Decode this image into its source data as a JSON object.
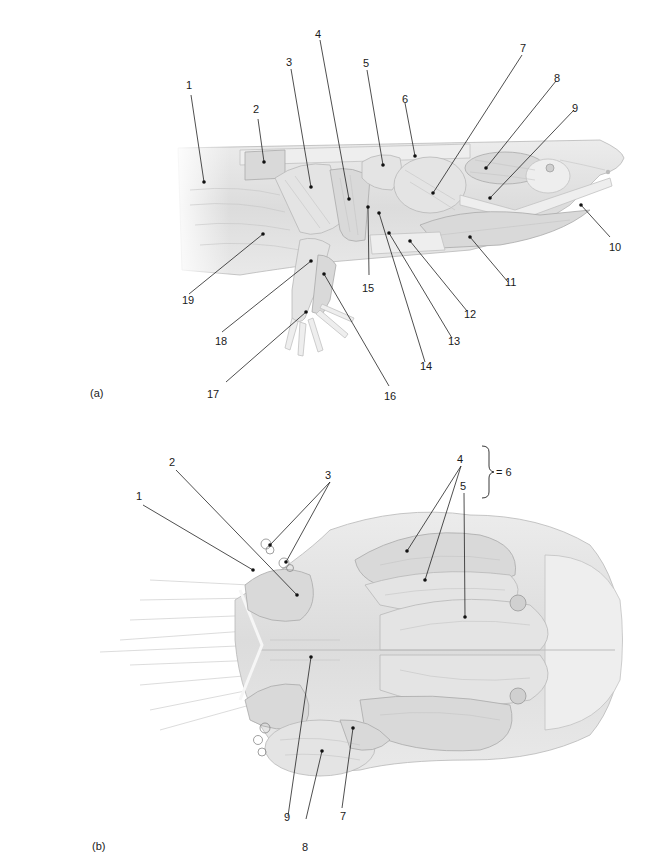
{
  "figure": {
    "type": "anatomical-illustration",
    "panels": [
      {
        "id": "a",
        "label": "(a)",
        "view": "lateral",
        "callouts": [
          "1",
          "2",
          "3",
          "4",
          "5",
          "6",
          "7",
          "8",
          "9",
          "10",
          "11",
          "12",
          "13",
          "14",
          "15",
          "16",
          "17",
          "18",
          "19"
        ]
      },
      {
        "id": "b",
        "label": "(b)",
        "view": "ventral",
        "callouts": [
          "1",
          "2",
          "3",
          "4",
          "5",
          "7",
          "8",
          "9"
        ],
        "bracket_note": "= 6",
        "bracket_groups": [
          "4",
          "5"
        ]
      }
    ]
  },
  "panel_a": {
    "label": "(a)",
    "numbers": {
      "n1": "1",
      "n2": "2",
      "n3": "3",
      "n4": "4",
      "n5": "5",
      "n6": "6",
      "n7": "7",
      "n8": "8",
      "n9": "9",
      "n10": "10",
      "n11": "11",
      "n12": "12",
      "n13": "13",
      "n14": "14",
      "n15": "15",
      "n16": "16",
      "n17": "17",
      "n18": "18",
      "n19": "19"
    }
  },
  "panel_b": {
    "label": "(b)",
    "bracket_text": "= 6",
    "numbers": {
      "n1": "1",
      "n2": "2",
      "n3": "3",
      "n4": "4",
      "n5": "5",
      "n7": "7",
      "n8": "8",
      "n9": "9"
    }
  }
}
